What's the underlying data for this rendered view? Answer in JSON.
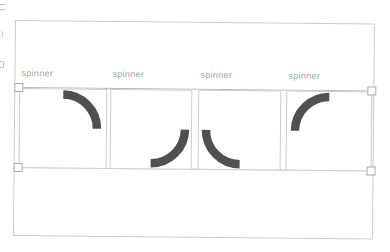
{
  "canvas": {
    "background": "#ffffff",
    "border_color": "#c9cbca"
  },
  "selection": {
    "border_color": "#b6b9b8",
    "handle_fill": "#ffffff",
    "handle_border": "#a6a9a8"
  },
  "spinners": [
    {
      "label": "spinner",
      "rotation_deg": 0
    },
    {
      "label": "spinner",
      "rotation_deg": 90
    },
    {
      "label": "spinner",
      "rotation_deg": 180
    },
    {
      "label": "spinner",
      "rotation_deg": 270
    }
  ],
  "colors": {
    "arc": "#505050",
    "frame_border": "#cccccc",
    "label_text": "#a4a4a4"
  }
}
